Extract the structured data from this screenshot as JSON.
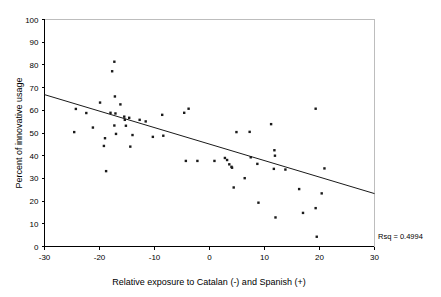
{
  "chart_data": {
    "type": "scatter",
    "title": "",
    "xlabel": "Relative exposure to Catalan (-) and Spanish (+)",
    "ylabel": "Percent of innovative usage",
    "xlim": [
      -30,
      30
    ],
    "ylim": [
      0,
      100
    ],
    "xticks": [
      -30,
      -20,
      -10,
      0,
      10,
      20,
      30
    ],
    "xtick_labels": [
      "-30",
      "-20",
      "-10",
      "0",
      "10",
      "20",
      "30"
    ],
    "yticks": [
      0,
      10,
      20,
      30,
      40,
      50,
      60,
      70,
      80,
      90,
      100
    ],
    "ytick_labels": [
      "0",
      "10",
      "20",
      "30",
      "40",
      "50",
      "60",
      "70",
      "80",
      "90",
      "100"
    ],
    "grid": false,
    "legend": false,
    "marker": "square",
    "marker_color": "#1a1a1a",
    "annotation": "Rsq = 0.4994",
    "rsq": 0.4994,
    "fit_line": {
      "type": "linear",
      "x_start": -30,
      "y_start": 66.9,
      "x_end": 30,
      "y_end": 23.3,
      "slope": -0.727,
      "intercept": 45.1
    },
    "points": [
      {
        "x": -24.3,
        "y": 60.6
      },
      {
        "x": -24.6,
        "y": 50.4
      },
      {
        "x": -22.4,
        "y": 58.8
      },
      {
        "x": -21.2,
        "y": 52.4
      },
      {
        "x": -19.9,
        "y": 63.4
      },
      {
        "x": -19.0,
        "y": 47.7
      },
      {
        "x": -19.2,
        "y": 44.3
      },
      {
        "x": -18.8,
        "y": 33.2
      },
      {
        "x": -18.0,
        "y": 58.9
      },
      {
        "x": -17.7,
        "y": 77.2
      },
      {
        "x": -17.3,
        "y": 81.4
      },
      {
        "x": -17.2,
        "y": 66.1
      },
      {
        "x": -17.1,
        "y": 58.6
      },
      {
        "x": -17.3,
        "y": 53.3
      },
      {
        "x": -17.0,
        "y": 49.6
      },
      {
        "x": -16.2,
        "y": 62.6
      },
      {
        "x": -15.5,
        "y": 57.2
      },
      {
        "x": -15.4,
        "y": 55.8
      },
      {
        "x": -15.2,
        "y": 53.2
      },
      {
        "x": -14.6,
        "y": 56.7
      },
      {
        "x": -14.4,
        "y": 44.0
      },
      {
        "x": -14.0,
        "y": 49.1
      },
      {
        "x": -12.7,
        "y": 55.8
      },
      {
        "x": -11.6,
        "y": 55.1
      },
      {
        "x": -10.3,
        "y": 48.3
      },
      {
        "x": -8.6,
        "y": 58.0
      },
      {
        "x": -8.4,
        "y": 48.8
      },
      {
        "x": -4.6,
        "y": 58.9
      },
      {
        "x": -3.8,
        "y": 60.7
      },
      {
        "x": -4.3,
        "y": 37.7
      },
      {
        "x": -2.2,
        "y": 37.7
      },
      {
        "x": 0.9,
        "y": 37.7
      },
      {
        "x": 2.8,
        "y": 39.0
      },
      {
        "x": 3.2,
        "y": 38.1
      },
      {
        "x": 3.6,
        "y": 36.2
      },
      {
        "x": 4.0,
        "y": 35.1
      },
      {
        "x": 4.1,
        "y": 34.7
      },
      {
        "x": 4.4,
        "y": 26.0
      },
      {
        "x": 4.9,
        "y": 50.4
      },
      {
        "x": 6.4,
        "y": 30.1
      },
      {
        "x": 7.3,
        "y": 50.5
      },
      {
        "x": 7.5,
        "y": 39.3
      },
      {
        "x": 8.7,
        "y": 36.4
      },
      {
        "x": 8.9,
        "y": 19.3
      },
      {
        "x": 11.2,
        "y": 53.9
      },
      {
        "x": 11.8,
        "y": 42.4
      },
      {
        "x": 11.9,
        "y": 40.0
      },
      {
        "x": 11.7,
        "y": 34.2
      },
      {
        "x": 12.0,
        "y": 12.8
      },
      {
        "x": 13.8,
        "y": 33.9
      },
      {
        "x": 16.3,
        "y": 25.3
      },
      {
        "x": 17.0,
        "y": 14.8
      },
      {
        "x": 19.3,
        "y": 60.7
      },
      {
        "x": 19.3,
        "y": 16.9
      },
      {
        "x": 19.5,
        "y": 4.3
      },
      {
        "x": 20.4,
        "y": 23.4
      },
      {
        "x": 20.9,
        "y": 34.4
      }
    ]
  }
}
